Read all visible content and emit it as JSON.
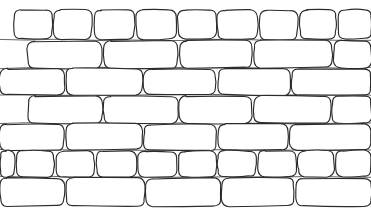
{
  "figure": {
    "width": 371,
    "height": 218,
    "background_color": "#ffffff",
    "stroke_color": "#2b2b2b",
    "mortar_color": "#4a4a4a",
    "style": "hand-drawn-sketch",
    "row_count": 7,
    "brick_count": 41
  },
  "chart_data": {
    "type": "diagram",
    "rows": [
      {
        "row_index": 0,
        "label": "row-1-top-stretchers",
        "y": 10,
        "height": 29,
        "brick_count": 9,
        "bricks": [
          {
            "x": 14,
            "w": 38
          },
          {
            "x": 54,
            "w": 38
          },
          {
            "x": 94,
            "w": 40
          },
          {
            "x": 136,
            "w": 40
          },
          {
            "x": 178,
            "w": 38
          },
          {
            "x": 218,
            "w": 40
          },
          {
            "x": 260,
            "w": 38
          },
          {
            "x": 300,
            "w": 36
          },
          {
            "x": 338,
            "w": 33
          }
        ]
      },
      {
        "row_index": 1,
        "label": "row-2-wide-stretchers",
        "y": 41,
        "height": 27,
        "brick_count": 5,
        "bricks": [
          {
            "x": 28,
            "w": 74
          },
          {
            "x": 104,
            "w": 74
          },
          {
            "x": 180,
            "w": 72
          },
          {
            "x": 254,
            "w": 78
          },
          {
            "x": 334,
            "w": 37
          }
        ]
      },
      {
        "row_index": 2,
        "label": "row-3-offset-stretchers",
        "y": 69,
        "height": 26,
        "brick_count": 5,
        "bricks": [
          {
            "x": 0,
            "w": 64
          },
          {
            "x": 66,
            "w": 76
          },
          {
            "x": 144,
            "w": 72
          },
          {
            "x": 218,
            "w": 72
          },
          {
            "x": 292,
            "w": 79
          }
        ]
      },
      {
        "row_index": 3,
        "label": "row-4-wide-stretchers",
        "y": 96,
        "height": 27,
        "brick_count": 5,
        "bricks": [
          {
            "x": 28,
            "w": 74
          },
          {
            "x": 104,
            "w": 74
          },
          {
            "x": 180,
            "w": 72
          },
          {
            "x": 254,
            "w": 76
          },
          {
            "x": 332,
            "w": 39
          }
        ]
      },
      {
        "row_index": 4,
        "label": "row-5-offset-stretchers",
        "y": 124,
        "height": 26,
        "brick_count": 5,
        "bricks": [
          {
            "x": 0,
            "w": 64
          },
          {
            "x": 66,
            "w": 76
          },
          {
            "x": 144,
            "w": 72
          },
          {
            "x": 218,
            "w": 70
          },
          {
            "x": 290,
            "w": 81
          }
        ]
      },
      {
        "row_index": 5,
        "label": "row-6-small-headers",
        "y": 151,
        "height": 26,
        "brick_count": 10,
        "bricks": [
          {
            "x": 0,
            "w": 14
          },
          {
            "x": 16,
            "w": 38
          },
          {
            "x": 56,
            "w": 38
          },
          {
            "x": 96,
            "w": 40
          },
          {
            "x": 138,
            "w": 38
          },
          {
            "x": 178,
            "w": 38
          },
          {
            "x": 218,
            "w": 38
          },
          {
            "x": 258,
            "w": 38
          },
          {
            "x": 298,
            "w": 36
          },
          {
            "x": 336,
            "w": 35
          }
        ]
      },
      {
        "row_index": 6,
        "label": "row-7-bottom-stretchers",
        "y": 178,
        "height": 28,
        "brick_count": 5,
        "bricks": [
          {
            "x": 0,
            "w": 64
          },
          {
            "x": 66,
            "w": 78
          },
          {
            "x": 146,
            "w": 74
          },
          {
            "x": 222,
            "w": 72
          },
          {
            "x": 296,
            "w": 75
          }
        ]
      }
    ],
    "mortar_lines": [
      {
        "label": "mortar-line-1",
        "y": 40,
        "x_start": 0,
        "x_end": 371
      },
      {
        "label": "mortar-line-2",
        "y": 68,
        "x_start": 0,
        "x_end": 371
      },
      {
        "label": "mortar-line-3",
        "y": 95,
        "x_start": 0,
        "x_end": 371
      },
      {
        "label": "mortar-line-4",
        "y": 123,
        "x_start": 0,
        "x_end": 371
      },
      {
        "label": "mortar-line-5",
        "y": 150,
        "x_start": 0,
        "x_end": 371
      },
      {
        "label": "mortar-line-6",
        "y": 177,
        "x_start": 0,
        "x_end": 371
      }
    ]
  }
}
